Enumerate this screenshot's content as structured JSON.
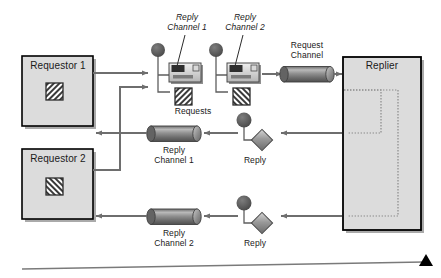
{
  "diagram": {
    "background_color": "#ffffff",
    "nodes": {
      "requestor1": {
        "label": "Requestor 1",
        "icon": "hatch-forward-icon",
        "fill": "#dcdcdc",
        "border": "#000000"
      },
      "requestor2": {
        "label": "Requestor 2",
        "icon": "hatch-backward-icon",
        "fill": "#dcdcdc",
        "border": "#000000"
      },
      "replier": {
        "label": "Replier",
        "fill": "#dcdcdc",
        "border": "#000000"
      }
    },
    "labels": {
      "reply_channel_1_callout": "Reply\nChannel 1",
      "reply_channel_2_callout": "Reply\nChannel 2",
      "requests": "Requests",
      "request_channel": "Request\nChannel",
      "reply_channel_1": "Reply\nChannel 1",
      "reply_channel_2": "Reply\nChannel 2",
      "reply_msg_1": "Reply",
      "reply_msg_2": "Reply"
    },
    "channels": [
      {
        "name": "request-channel",
        "label": "Request\nChannel",
        "orientation": "horizontal"
      },
      {
        "name": "reply-channel-1",
        "label": "Reply\nChannel 1",
        "orientation": "horizontal"
      },
      {
        "name": "reply-channel-2",
        "label": "Reply\nChannel 2",
        "orientation": "horizontal"
      }
    ],
    "messages": [
      {
        "name": "request-message-1",
        "icon": "message-card-icon",
        "attachment": "hatch-forward-icon"
      },
      {
        "name": "request-message-2",
        "icon": "message-card-icon",
        "attachment": "hatch-backward-icon"
      },
      {
        "name": "reply-message-1",
        "icon": "diamond-message-icon"
      },
      {
        "name": "reply-message-2",
        "icon": "diamond-message-icon"
      }
    ],
    "colors": {
      "box_fill": "#dcdcdc",
      "box_stroke": "#000000",
      "arrow": "#6e6e6e",
      "cylinder_dark": "#5a5a5a",
      "cylinder_light": "#b8b8b8",
      "node_circle": "#555555",
      "dotted_route": "#8a8a8a",
      "footer_rule": "#7a7a7a",
      "footer_triangle": "#000000"
    }
  }
}
